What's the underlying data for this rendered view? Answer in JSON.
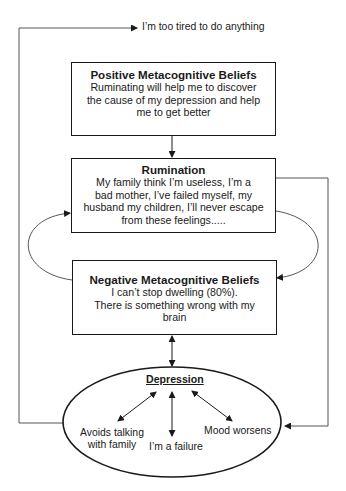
{
  "diagram": {
    "top_feedback": {
      "label": "I’m too tired to do anything"
    },
    "positive_beliefs": {
      "title": "Positive Metacognitive Beliefs",
      "lines": [
        "Ruminating will help me to discover",
        "the cause of my depression and help",
        "me to get better"
      ]
    },
    "rumination": {
      "title": "Rumination",
      "lines": [
        "My family think I’m useless, I’m a",
        "bad mother, I’ve failed myself, my",
        "husband my children, I’ll never escape",
        "from these feelings....."
      ]
    },
    "negative_beliefs": {
      "title": "Negative Metacognitive Beliefs",
      "lines": [
        "I can’t stop dwelling (80%).",
        "There is something wrong with my",
        "brain"
      ]
    },
    "depression": {
      "title": "Depression",
      "consequences": [
        {
          "lines": [
            "Avoids talking",
            "with family"
          ]
        },
        {
          "lines": [
            "I’m a failure"
          ]
        },
        {
          "lines": [
            "Mood worsens"
          ]
        }
      ]
    },
    "colors": {
      "line": "#1a1a1a",
      "background": "#ffffff"
    }
  }
}
